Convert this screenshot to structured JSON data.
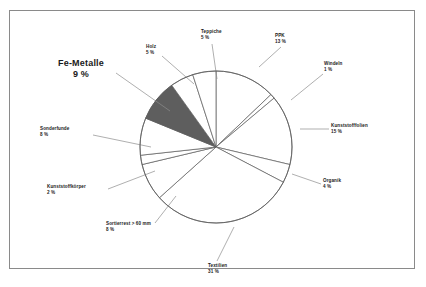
{
  "chart_data": {
    "type": "pie",
    "title": "",
    "subtitle": "",
    "xlabel": "",
    "ylabel": "",
    "legend_position": "none",
    "grid": false,
    "units": "%",
    "categories": [
      "PPK",
      "Windeln",
      "Kunststofffolien",
      "Organik",
      "Textilien",
      "Sortierrest > 60 mm",
      "Kunststoffkörper",
      "Sonderfunde",
      "Fe-Metalle",
      "Holz",
      "Teppiche"
    ],
    "values": [
      13,
      1,
      15,
      4,
      31,
      8,
      2,
      8,
      9,
      5,
      5
    ],
    "slices": [
      {
        "name": "PPK",
        "value": 13,
        "label_name": "PPK",
        "label_pct": "13 %",
        "color": "#ffffff",
        "highlight": false,
        "label_x": 265,
        "label_y": 22,
        "label_align": "left",
        "leader": [
          [
            271,
            36
          ],
          [
            249,
            56
          ]
        ]
      },
      {
        "name": "Windeln",
        "value": 1,
        "label_name": "Windeln",
        "label_pct": "1 %",
        "color": "#ffffff",
        "highlight": false,
        "label_x": 314,
        "label_y": 50,
        "label_align": "left",
        "leader": [
          [
            313,
            63
          ],
          [
            281,
            89
          ]
        ]
      },
      {
        "name": "Kunststofffolien",
        "value": 15,
        "label_name": "Kunststofffolien",
        "label_pct": "15 %",
        "color": "#ffffff",
        "highlight": false,
        "label_x": 321,
        "label_y": 112,
        "label_align": "left",
        "leader": [
          [
            319,
            118
          ],
          [
            290,
            118
          ]
        ]
      },
      {
        "name": "Organik",
        "value": 4,
        "label_name": "Organik",
        "label_pct": "4 %",
        "color": "#ffffff",
        "highlight": false,
        "label_x": 313,
        "label_y": 167,
        "label_align": "left",
        "leader": [
          [
            311,
            173
          ],
          [
            282,
            163
          ]
        ]
      },
      {
        "name": "Textilien",
        "value": 31,
        "label_name": "Textilien",
        "label_pct": "31 %",
        "color": "#ffffff",
        "highlight": false,
        "label_x": 198,
        "label_y": 252,
        "label_align": "left",
        "leader": [
          [
            207,
            250
          ],
          [
            224,
            216
          ]
        ]
      },
      {
        "name": "Sortierrest > 60 mm",
        "value": 8,
        "label_name": "Sortierrest > 60 mm",
        "label_pct": "8 %",
        "color": "#ffffff",
        "highlight": false,
        "label_x": 96,
        "label_y": 210,
        "label_align": "left",
        "leader": [
          [
            145,
            212
          ],
          [
            166,
            185
          ]
        ]
      },
      {
        "name": "Kunststoffkörper",
        "value": 2,
        "label_name": "Kunststoffkörper",
        "label_pct": "2 %",
        "color": "#ffffff",
        "highlight": false,
        "label_x": 37,
        "label_y": 173,
        "label_align": "left",
        "leader": [
          [
            98,
            178
          ],
          [
            145,
            160
          ]
        ]
      },
      {
        "name": "Sonderfunde",
        "value": 8,
        "label_name": "Sonderfunde",
        "label_pct": "8 %",
        "color": "#ffffff",
        "highlight": false,
        "label_x": 30,
        "label_y": 115,
        "label_align": "left",
        "leader": [
          [
            83,
            124
          ],
          [
            141,
            136
          ]
        ]
      },
      {
        "name": "Fe-Metalle",
        "value": 9,
        "label_name": "Fe-Metalle",
        "label_pct": "9 %",
        "color": "#5e5e5e",
        "highlight": true,
        "label_x": 48,
        "label_y": 47,
        "label_align": "center",
        "leader": [
          [
            106,
            62
          ],
          [
            160,
            100
          ]
        ]
      },
      {
        "name": "Holz",
        "value": 5,
        "label_name": "Holz",
        "label_pct": "5 %",
        "color": "#ffffff",
        "highlight": false,
        "label_x": 136,
        "label_y": 33,
        "label_align": "left",
        "leader": [
          [
            152,
            45
          ],
          [
            184,
            73
          ]
        ]
      },
      {
        "name": "Teppiche",
        "value": 5,
        "label_name": "Teppiche",
        "label_pct": "5 %",
        "color": "#ffffff",
        "highlight": false,
        "label_x": 191,
        "label_y": 18,
        "label_align": "left",
        "leader": [
          [
            202,
            33
          ],
          [
            207,
            68
          ]
        ]
      }
    ],
    "geometry": {
      "center_x": 206,
      "center_y": 136,
      "radius": 76,
      "start_angle_deg": -90
    }
  }
}
